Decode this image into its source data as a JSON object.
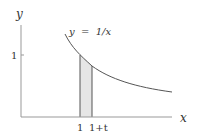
{
  "diagram": {
    "axes": {
      "x_label": "x",
      "y_label": "y",
      "y_tick_label": "1"
    },
    "curve": {
      "label": "y  =  1/x",
      "function": "1/x",
      "x_range": [
        0.75,
        2.56
      ]
    },
    "strip": {
      "left_label": "1",
      "right_label": "1+t",
      "left_x": 1,
      "right_x": 1.2,
      "fill": "#e6e6e6"
    },
    "colors": {
      "line": "#555555",
      "axis": "#888888",
      "text": "#333333"
    }
  }
}
